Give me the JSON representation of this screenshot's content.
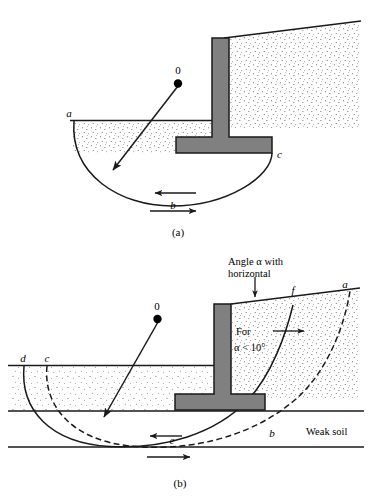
{
  "figure": {
    "colors": {
      "line": "#1a1a1a",
      "wall_fill": "#808080",
      "wall_stroke": "#1a1a1a",
      "soil_stipple": "#4d4d4d",
      "background": "#ffffff"
    }
  },
  "panel_a": {
    "caption": "(a)",
    "labels": {
      "center": "0",
      "point_a": "a",
      "point_b": "b",
      "point_c": "c"
    }
  },
  "panel_b": {
    "caption": "(b)",
    "labels": {
      "center": "0",
      "point_a": "a",
      "point_b": "b",
      "point_c": "c",
      "point_d": "d",
      "point_e": "e",
      "point_f": "f"
    },
    "annotations": {
      "angle_note_line1": "Angle α with",
      "angle_note_line2": "horizontal",
      "for_note_line1": "For",
      "for_note_line2": "α < 10°",
      "weak_soil": "Weak soil"
    }
  }
}
